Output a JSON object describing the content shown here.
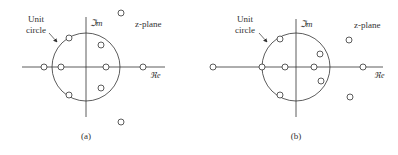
{
  "figure": {
    "panels": [
      {
        "id": "a",
        "caption": "(a)",
        "unit_circle_label_line1": "Unit",
        "unit_circle_label_line2": "circle",
        "imag_axis_label": "ℑm",
        "real_axis_label": "ℜe",
        "plane_label": "z-plane",
        "zeros": [
          {
            "x": 44,
            "y": 67
          },
          {
            "x": 61,
            "y": 67
          },
          {
            "x": 106,
            "y": 67
          },
          {
            "x": 143,
            "y": 67
          },
          {
            "x": 69,
            "y": 38
          },
          {
            "x": 69,
            "y": 95
          },
          {
            "x": 101,
            "y": 45
          },
          {
            "x": 101,
            "y": 88
          },
          {
            "x": 121,
            "y": 13
          },
          {
            "x": 121,
            "y": 122
          }
        ]
      },
      {
        "id": "b",
        "caption": "(b)",
        "unit_circle_label_line1": "Unit",
        "unit_circle_label_line2": "circle",
        "imag_axis_label": "ℑm",
        "real_axis_label": "ℜe",
        "plane_label": "z-plane",
        "zeros": [
          {
            "x": 213,
            "y": 67
          },
          {
            "x": 262,
            "y": 67
          },
          {
            "x": 285,
            "y": 67
          },
          {
            "x": 314,
            "y": 67
          },
          {
            "x": 363,
            "y": 67
          },
          {
            "x": 280,
            "y": 39
          },
          {
            "x": 280,
            "y": 95
          },
          {
            "x": 320,
            "y": 54
          },
          {
            "x": 321,
            "y": 81
          },
          {
            "x": 349,
            "y": 40
          },
          {
            "x": 350,
            "y": 97
          }
        ]
      }
    ]
  }
}
